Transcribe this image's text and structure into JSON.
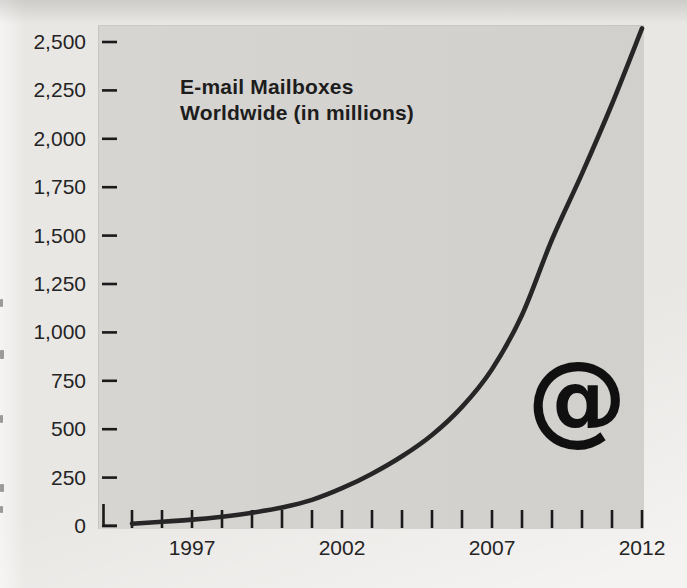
{
  "chart": {
    "title_line1": "E-mail Mailboxes",
    "title_line2": "Worldwide (in millions)",
    "at_symbol": "@"
  },
  "chart_data": {
    "type": "line",
    "title": "E-mail Mailboxes Worldwide (in millions)",
    "series_name": "E-mail mailboxes worldwide (millions)",
    "x": [
      1995,
      1996,
      1997,
      1998,
      1999,
      2000,
      2001,
      2002,
      2003,
      2004,
      2005,
      2006,
      2007,
      2008,
      2009,
      2010,
      2011,
      2012
    ],
    "values": [
      12,
      22,
      33,
      48,
      68,
      95,
      135,
      195,
      270,
      360,
      470,
      615,
      810,
      1090,
      1480,
      1820,
      2180,
      2570
    ],
    "xlim": [
      1995,
      2012
    ],
    "ylim": [
      0,
      2500
    ],
    "x_tick_interval": 1,
    "y_tick_interval": 250,
    "y_tick_values": [
      2500,
      2250,
      2000,
      1750,
      1500,
      1250,
      1000,
      750,
      500,
      250,
      0
    ],
    "y_tick_labels": [
      "2,500",
      "2,250",
      "2,000",
      "1,750",
      "1,500",
      "1,250",
      "1,000",
      "750",
      "500",
      "250",
      "0"
    ],
    "x_labeled_ticks": [
      {
        "year": 1997,
        "label": "1997"
      },
      {
        "year": 2002,
        "label": "2002"
      },
      {
        "year": 2007,
        "label": "2007"
      },
      {
        "year": 2012,
        "label": "2012"
      }
    ],
    "grid": false,
    "legend": "none",
    "annotation": "large @ glyph inside plot area near lower right",
    "line_color": "#262626",
    "tick_color": "#1a1a1a",
    "plot_bg": "#d4d2cf",
    "page_bg": "#e9e7e4",
    "text_color": "#242424"
  }
}
